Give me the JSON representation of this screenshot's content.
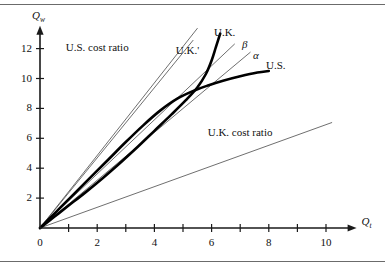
{
  "chart_data": {
    "type": "line",
    "title": "",
    "subtitle": "",
    "xlabel": "Q_t",
    "ylabel": "Q_w",
    "xlabel_base": "Q",
    "xlabel_sub": "t",
    "ylabel_base": "Q",
    "ylabel_sub": "w",
    "xlim": [
      0,
      11
    ],
    "ylim": [
      0,
      13.4
    ],
    "grid": false,
    "legend_position": "inline-annotations",
    "x_ticks_major": [
      0,
      2,
      4,
      6,
      8,
      10
    ],
    "x_ticks_minor": [
      1,
      3,
      5,
      7,
      9
    ],
    "x_tick_labels": [
      "0",
      "2",
      "4",
      "6",
      "8",
      "10"
    ],
    "y_ticks_major": [
      2,
      4,
      6,
      8,
      10,
      12
    ],
    "y_tick_labels": [
      "2",
      "4",
      "6",
      "8",
      "10",
      "12"
    ],
    "series": [
      {
        "name": "U.S.",
        "label": "U.S.",
        "style": "thick-curve",
        "color": "#000000",
        "width": 2.6,
        "description": "United States offer curve, concave from above, flattening near Qw=10.5",
        "points": [
          [
            0,
            0
          ],
          [
            0.6,
            1.15
          ],
          [
            1.2,
            2.3
          ],
          [
            1.8,
            3.45
          ],
          [
            2.4,
            4.6
          ],
          [
            3.0,
            5.75
          ],
          [
            3.6,
            6.85
          ],
          [
            4.2,
            7.85
          ],
          [
            4.8,
            8.65
          ],
          [
            5.4,
            9.2
          ],
          [
            5.9,
            9.55
          ],
          [
            6.4,
            9.85
          ],
          [
            7.0,
            10.15
          ],
          [
            7.6,
            10.4
          ],
          [
            8.0,
            10.5
          ]
        ]
      },
      {
        "name": "U.K.",
        "label": "U.K.",
        "style": "thick-curve",
        "color": "#000000",
        "width": 2.6,
        "description": "United Kingdom offer curve, convex from above, rising steeply past the intersection",
        "points": [
          [
            0,
            0
          ],
          [
            0.5,
            0.75
          ],
          [
            1.0,
            1.5
          ],
          [
            1.6,
            2.4
          ],
          [
            2.2,
            3.35
          ],
          [
            2.8,
            4.35
          ],
          [
            3.4,
            5.4
          ],
          [
            4.0,
            6.5
          ],
          [
            4.6,
            7.6
          ],
          [
            5.1,
            8.55
          ],
          [
            5.5,
            9.4
          ],
          [
            5.8,
            10.3
          ],
          [
            6.0,
            11.2
          ],
          [
            6.15,
            12.1
          ],
          [
            6.3,
            13.0
          ]
        ]
      },
      {
        "name": "U.K.'",
        "label": "U.K.'",
        "style": "thin-line",
        "color": "#4a4a4a",
        "width": 0.8,
        "description": "Shifted U.K. offer curve / alternative trade line from origin",
        "points": [
          [
            0,
            0
          ],
          [
            5.35,
            12.55
          ]
        ]
      },
      {
        "name": "beta",
        "label": "β",
        "style": "thin-line",
        "color": "#4a4a4a",
        "width": 0.8,
        "description": "Terms-of-trade ray beta through the origin",
        "points": [
          [
            0,
            0
          ],
          [
            6.8,
            12.3
          ]
        ]
      },
      {
        "name": "alpha",
        "label": "α",
        "style": "thin-line",
        "color": "#4a4a4a",
        "width": 0.8,
        "description": "Terms-of-trade ray alpha through the origin",
        "points": [
          [
            0,
            0
          ],
          [
            7.35,
            11.75
          ]
        ]
      },
      {
        "name": "us-cost-ratio",
        "label": "U.S. cost ratio",
        "style": "thin-line",
        "color": "#4a4a4a",
        "width": 0.8,
        "description": "U.S. domestic cost ratio line, steep slope from origin",
        "points": [
          [
            0,
            0
          ],
          [
            5.5,
            13.35
          ]
        ]
      },
      {
        "name": "uk-cost-ratio",
        "label": "U.K. cost ratio",
        "style": "thin-line",
        "color": "#4a4a4a",
        "width": 0.8,
        "description": "U.K. domestic cost ratio line, shallow slope from origin",
        "points": [
          [
            0,
            0
          ],
          [
            10.2,
            7.05
          ]
        ]
      }
    ],
    "annotations": [
      {
        "text": "U.S. cost ratio",
        "x": 2.0,
        "y": 12.1,
        "name": "us-cost-ratio-label"
      },
      {
        "text": "U.K. cost ratio",
        "x": 7.0,
        "y": 6.4,
        "name": "uk-cost-ratio-label"
      },
      {
        "text": "U.K.",
        "x": 6.45,
        "y": 13.1,
        "name": "uk-curve-label"
      },
      {
        "text": "U.K.'",
        "x": 5.15,
        "y": 11.9,
        "name": "uk-prime-curve-label"
      },
      {
        "text": "β",
        "x": 7.15,
        "y": 12.25,
        "name": "beta-label"
      },
      {
        "text": "α",
        "x": 7.55,
        "y": 11.55,
        "name": "alpha-label"
      },
      {
        "text": "U.S.",
        "x": 8.25,
        "y": 10.85,
        "name": "us-curve-label"
      }
    ],
    "colors": {
      "axis": "#1a1a1a",
      "thick_curve": "#000000",
      "thin_line": "#4a4a4a",
      "rule": "#6b6b6b",
      "background": "#ffffff",
      "text": "#111111"
    }
  }
}
